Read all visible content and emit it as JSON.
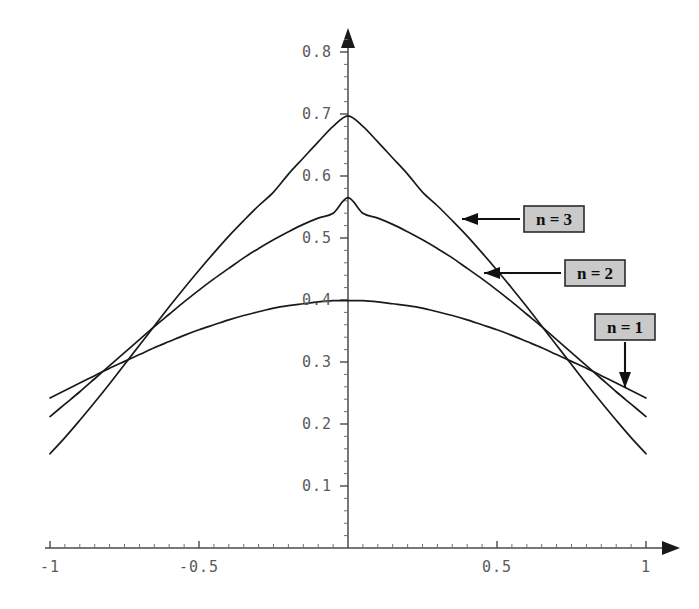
{
  "figure": {
    "background_color": "#ffffff",
    "curve_color": "#1a1a1a",
    "axis_color": "#4a4a4a",
    "label_color": "#5a5a5a",
    "annotation_fill": "#c9c9c9",
    "annotation_border": "#2b2b2b"
  },
  "axes": {
    "x_tick_labels": [
      "-1",
      "-0.5",
      "0.5",
      "1"
    ],
    "x_tick_values": [
      -1,
      -0.5,
      0.5,
      1
    ],
    "y_tick_labels": [
      "0.1",
      "0.2",
      "0.3",
      "0.4",
      "0.5",
      "0.6",
      "0.7",
      "0.8"
    ],
    "y_tick_values": [
      0.1,
      0.2,
      0.3,
      0.4,
      0.5,
      0.6,
      0.7,
      0.8
    ]
  },
  "annotations": [
    {
      "name": "n = 3",
      "label": "n = 3",
      "box_x": 524,
      "box_y": 206,
      "box_w": 60,
      "box_h": 26,
      "arrow_from_x": 520,
      "arrow_from_y": 219,
      "arrow_to_x": 462,
      "arrow_to_y": 219,
      "arrow_dir": "left"
    },
    {
      "name": "n = 2",
      "label": "n = 2",
      "box_x": 565,
      "box_y": 260,
      "box_w": 60,
      "box_h": 26,
      "arrow_from_x": 561,
      "arrow_from_y": 273,
      "arrow_to_x": 484,
      "arrow_to_y": 273,
      "arrow_dir": "left"
    },
    {
      "name": "n = 1",
      "label": "n = 1",
      "box_x": 595,
      "box_y": 314,
      "box_w": 60,
      "box_h": 26,
      "arrow_from_x": 625,
      "arrow_from_y": 342,
      "arrow_to_x": 625,
      "arrow_to_y": 388,
      "arrow_dir": "down"
    }
  ],
  "chart_data": {
    "type": "line",
    "title": "",
    "xlabel": "",
    "ylabel": "",
    "xlim": [
      -1.05,
      1.05
    ],
    "ylim": [
      0,
      0.82
    ],
    "grid": false,
    "legend": "annotated-callouts",
    "x": [
      -1.0,
      -0.95,
      -0.9,
      -0.85,
      -0.8,
      -0.75,
      -0.7,
      -0.65,
      -0.6,
      -0.55,
      -0.5,
      -0.45,
      -0.4,
      -0.35,
      -0.3,
      -0.25,
      -0.2,
      -0.15,
      -0.1,
      -0.05,
      0.0,
      0.05,
      0.1,
      0.15,
      0.2,
      0.25,
      0.3,
      0.35,
      0.4,
      0.45,
      0.5,
      0.55,
      0.6,
      0.65,
      0.7,
      0.75,
      0.8,
      0.85,
      0.9,
      0.95,
      1.0
    ],
    "series": [
      {
        "name": "n = 1",
        "peak_value": 0.399,
        "endpoint_value": 0.242,
        "values": [
          0.242,
          0.254,
          0.266,
          0.278,
          0.29,
          0.301,
          0.312,
          0.323,
          0.333,
          0.343,
          0.352,
          0.36,
          0.368,
          0.375,
          0.381,
          0.387,
          0.391,
          0.394,
          0.397,
          0.399,
          0.399,
          0.399,
          0.397,
          0.394,
          0.391,
          0.387,
          0.381,
          0.375,
          0.368,
          0.36,
          0.352,
          0.343,
          0.333,
          0.323,
          0.312,
          0.301,
          0.29,
          0.278,
          0.266,
          0.254,
          0.242
        ]
      },
      {
        "name": "n = 2",
        "peak_value": 0.565,
        "endpoint_value": 0.212,
        "values": [
          0.212,
          0.232,
          0.252,
          0.273,
          0.294,
          0.315,
          0.336,
          0.357,
          0.377,
          0.397,
          0.416,
          0.434,
          0.451,
          0.468,
          0.483,
          0.497,
          0.51,
          0.522,
          0.532,
          0.54,
          0.565,
          0.54,
          0.532,
          0.522,
          0.51,
          0.497,
          0.483,
          0.468,
          0.451,
          0.434,
          0.416,
          0.397,
          0.377,
          0.357,
          0.336,
          0.315,
          0.294,
          0.273,
          0.252,
          0.232,
          0.212
        ]
      },
      {
        "name": "n = 3",
        "peak_value": 0.697,
        "endpoint_value": 0.152,
        "values": [
          0.152,
          0.178,
          0.206,
          0.235,
          0.265,
          0.296,
          0.327,
          0.358,
          0.389,
          0.419,
          0.448,
          0.476,
          0.503,
          0.528,
          0.552,
          0.574,
          0.603,
          0.629,
          0.655,
          0.68,
          0.697,
          0.68,
          0.655,
          0.629,
          0.603,
          0.574,
          0.552,
          0.528,
          0.503,
          0.476,
          0.448,
          0.419,
          0.389,
          0.358,
          0.327,
          0.296,
          0.265,
          0.235,
          0.206,
          0.178,
          0.152
        ]
      }
    ]
  }
}
